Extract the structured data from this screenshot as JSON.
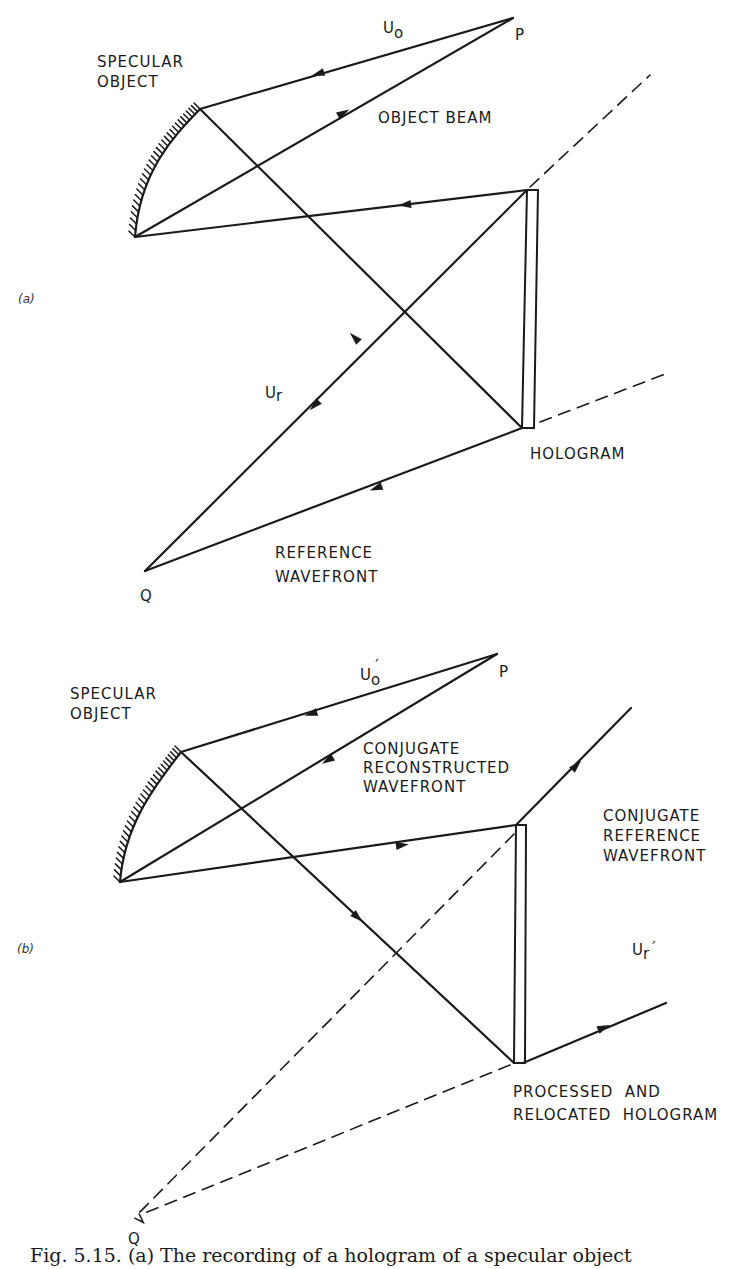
{
  "figure": {
    "ink_color": "#1a1a1a",
    "caption": "Fig. 5.15. (a) The recording of a hologram of a specular object",
    "panel_a": {
      "label": "(a)",
      "specular_object_label": [
        "SPECULAR",
        "OBJECT"
      ],
      "object_beam_label": "OBJECT BEAM",
      "uo_label": "U",
      "uo_sub": "o",
      "ur_label": "U",
      "ur_sub": "r",
      "p_label": "P",
      "q_label": "Q",
      "hologram_label": "HOLOGRAM",
      "reference_label": [
        "REFERENCE",
        "WAVEFRONT"
      ],
      "points": {
        "P": [
          513,
          18
        ],
        "Q": [
          145,
          571
        ],
        "obj_top": [
          200,
          109
        ],
        "obj_bot": [
          135,
          237
        ],
        "holo_top": [
          527,
          190
        ],
        "holo_bot": [
          522,
          428
        ]
      }
    },
    "panel_b": {
      "label": "(b)",
      "specular_object_label": [
        "SPECULAR",
        "OBJECT"
      ],
      "conj_recon_label": [
        "CONJUGATE",
        "RECONSTRUCTED",
        "WAVEFRONT"
      ],
      "conj_ref_label": [
        "CONJUGATE",
        "REFERENCE",
        "WAVEFRONT"
      ],
      "uo_label": "U",
      "uo_sub": "o",
      "uo_prime": "′",
      "ur_label": "U",
      "ur_sub": "r",
      "ur_prime": "′",
      "p_label": "P",
      "q_label": "Q",
      "hologram_label": [
        "PROCESSED  AND",
        "RELOCATED  HOLOGRAM"
      ],
      "points": {
        "P": [
          497,
          654
        ],
        "Q": [
          135,
          1217
        ],
        "obj_top": [
          181,
          752
        ],
        "obj_bot": [
          120,
          882
        ],
        "holo_top": [
          516,
          825
        ],
        "holo_bot": [
          514,
          1063
        ],
        "conj_ref_start": [
          631,
          708
        ],
        "ur_start": [
          666,
          1003
        ]
      }
    }
  }
}
